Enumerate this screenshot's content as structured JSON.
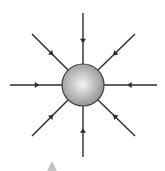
{
  "diagram": {
    "sphere": {
      "cx": 83,
      "cy": 85,
      "r": 21,
      "fill_light": "#f4f4f4",
      "fill_dark": "#8a8a8a",
      "stroke": "#3a3a3a"
    },
    "line_color": "#2b2b2b",
    "field_lines": [
      {
        "name": "top",
        "x1": 83,
        "y1": 13,
        "x2": 83,
        "y2": 64,
        "arrow_at": 0.55
      },
      {
        "name": "bottom",
        "x1": 83,
        "y1": 157,
        "x2": 83,
        "y2": 106,
        "arrow_at": 0.52
      },
      {
        "name": "left",
        "x1": 10,
        "y1": 85,
        "x2": 62,
        "y2": 85,
        "arrow_at": 0.52
      },
      {
        "name": "right",
        "x1": 157,
        "y1": 85,
        "x2": 104,
        "y2": 85,
        "arrow_at": 0.52
      },
      {
        "name": "upper-left",
        "x1": 32,
        "y1": 34,
        "x2": 68,
        "y2": 70,
        "arrow_at": 0.55
      },
      {
        "name": "upper-right",
        "x1": 135,
        "y1": 34,
        "x2": 98,
        "y2": 70,
        "arrow_at": 0.55
      },
      {
        "name": "lower-left",
        "x1": 32,
        "y1": 136,
        "x2": 68,
        "y2": 100,
        "arrow_at": 0.55
      },
      {
        "name": "lower-right",
        "x1": 135,
        "y1": 136,
        "x2": 98,
        "y2": 100,
        "arrow_at": 0.55
      }
    ],
    "marker": {
      "shape": "triangle",
      "color": "#c4c4c4",
      "points": "52,161 47,171 57,171"
    }
  }
}
